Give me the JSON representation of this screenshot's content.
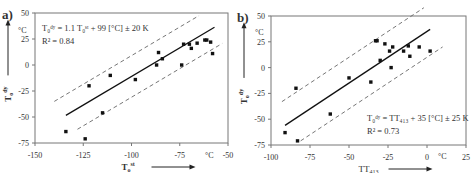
{
  "chart_data": [
    {
      "panel_label": "a)",
      "type": "scatter",
      "title": "",
      "xlabel": "T_o^st",
      "xlabel_main": "T",
      "xlabel_sub": "o",
      "xlabel_sup": "st",
      "ylabel": "T_o^dy",
      "ylabel_main": "T",
      "ylabel_sub": "o",
      "ylabel_sup": "dy",
      "unit": "°C",
      "xlim": [
        -150,
        -50
      ],
      "ylim": [
        -75,
        50
      ],
      "xticks": [
        -150,
        -125,
        -100,
        -75,
        -50
      ],
      "xtick_labels": [
        "-150",
        "-125",
        "-100",
        "-75",
        "-50"
      ],
      "yticks": [
        -75,
        -50,
        -25,
        0,
        25,
        50
      ],
      "ytick_labels": [
        "-75",
        "-50",
        "-25",
        "0",
        "25",
        "50"
      ],
      "grid": false,
      "equation": "T₀ᵈʸ = 1.1 T₀ˢᵗ + 99 [°C] ± 20 K",
      "r_squared": "R² = 0.84",
      "fit": {
        "slope": 1.1,
        "intercept": 99,
        "band": 20,
        "x_range": [
          -134,
          -57
        ],
        "band_x_range": [
          -140,
          -53
        ]
      },
      "points": [
        {
          "x": -134,
          "y": -64
        },
        {
          "x": -124,
          "y": -71
        },
        {
          "x": -122,
          "y": -20
        },
        {
          "x": -115,
          "y": -46
        },
        {
          "x": -111,
          "y": -10
        },
        {
          "x": -98,
          "y": -14
        },
        {
          "x": -87,
          "y": 0
        },
        {
          "x": -86,
          "y": 12
        },
        {
          "x": -84,
          "y": 6
        },
        {
          "x": -74,
          "y": 0
        },
        {
          "x": -73,
          "y": 20
        },
        {
          "x": -70,
          "y": 20
        },
        {
          "x": -69,
          "y": 16
        },
        {
          "x": -66,
          "y": 21
        },
        {
          "x": -62,
          "y": 24
        },
        {
          "x": -61,
          "y": 24
        },
        {
          "x": -59,
          "y": 22
        },
        {
          "x": -58,
          "y": 11
        }
      ]
    },
    {
      "panel_label": "b)",
      "type": "scatter",
      "title": "",
      "xlabel": "TT_413",
      "xlabel_main": "TT",
      "xlabel_sub": "413",
      "xlabel_sup": "",
      "ylabel": "T_o^dy",
      "ylabel_main": "T",
      "ylabel_sub": "o",
      "ylabel_sup": "dy",
      "unit": "°C",
      "xlim": [
        -100,
        25
      ],
      "ylim": [
        -75,
        50
      ],
      "xticks": [
        -100,
        -75,
        -50,
        -25,
        0,
        25
      ],
      "xtick_labels": [
        "-100",
        "-75",
        "-50",
        "-25",
        "0",
        "25"
      ],
      "yticks": [
        -75,
        -50,
        -25,
        0,
        25,
        50
      ],
      "ytick_labels": [
        "-75",
        "-50",
        "-25",
        "0",
        "25",
        "50"
      ],
      "grid": false,
      "equation": "T₀ᵈʸ = TT₄₁₃ + 35 [°C] ± 25 K",
      "r_squared": "R² = 0.73",
      "fit": {
        "slope": 1.0,
        "intercept": 35,
        "band": 25,
        "x_range": [
          -91,
          2
        ],
        "band_x_range": [
          -93,
          10
        ]
      },
      "points": [
        {
          "x": -91,
          "y": -63
        },
        {
          "x": -84,
          "y": -20
        },
        {
          "x": -83,
          "y": -71
        },
        {
          "x": -62,
          "y": -45
        },
        {
          "x": -50,
          "y": -10
        },
        {
          "x": -36,
          "y": -14
        },
        {
          "x": -33,
          "y": 26
        },
        {
          "x": -32,
          "y": 26
        },
        {
          "x": -30,
          "y": 7
        },
        {
          "x": -27,
          "y": 23
        },
        {
          "x": -24,
          "y": 16
        },
        {
          "x": -23,
          "y": 0
        },
        {
          "x": -22,
          "y": 20
        },
        {
          "x": -15,
          "y": 16
        },
        {
          "x": -12,
          "y": 21
        },
        {
          "x": -11,
          "y": 11
        },
        {
          "x": -5,
          "y": 20
        },
        {
          "x": 2,
          "y": 16
        }
      ]
    }
  ],
  "layout": [
    {
      "frame": {
        "left": 35,
        "top": 13,
        "right": 228,
        "bottom": 143
      },
      "equation_pos": [
        42,
        31
      ],
      "r2_pos": [
        42,
        44
      ],
      "panel_label_pos": [
        2,
        19
      ],
      "unit_y_pos": [
        18,
        33
      ],
      "unit_x_pos": [
        205,
        158
      ]
    },
    {
      "frame": {
        "left": 271,
        "top": 16,
        "right": 466,
        "bottom": 145
      },
      "equation_pos": [
        367,
        121
      ],
      "r2_pos": [
        367,
        134
      ],
      "panel_label_pos": [
        237,
        22
      ],
      "unit_y_pos": [
        255,
        35
      ],
      "unit_x_pos": [
        438,
        159
      ]
    }
  ],
  "colors": {
    "axis": "#777777",
    "text": "#333333",
    "fit": "#111111",
    "band": "#666666",
    "point": "#111111"
  }
}
